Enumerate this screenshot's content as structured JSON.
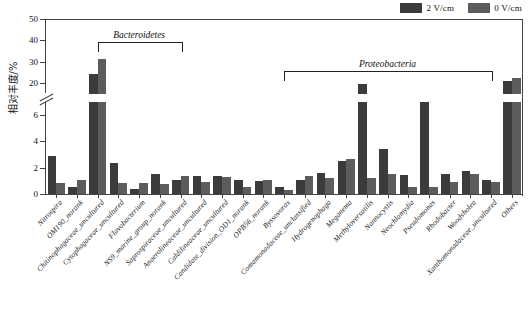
{
  "chart_data": {
    "type": "bar",
    "title": "",
    "xlabel": "",
    "ylabel": "相对丰度/%",
    "ylim": [
      0,
      50
    ],
    "axis_break": {
      "lower_max": 7,
      "upper_min": 15
    },
    "y_ticks_lower": [
      0,
      2,
      4,
      6
    ],
    "y_ticks_upper": [
      20,
      30,
      40,
      50
    ],
    "grid": false,
    "legend_position": "top-right",
    "categories": [
      "Nitrospira",
      "OM190_norank",
      "Chitinophagaceae_uncultured",
      "Cytophagaceae_uncultured",
      "Flavobacterium",
      "NS9_marine_group_norank",
      "Saprospiraceae_uncultured",
      "Anaerolineaceae_uncultured",
      "Caldilineaceae_uncultured",
      "Candidate_division_OD1_norank",
      "OPB56_norank",
      "Byssovorax",
      "Comamonadaceae_unclassified",
      "Hydrogenophaga",
      "Meganema",
      "Methyloversatilis",
      "Nannocystis",
      "Neochlamydia",
      "Pseudomonas",
      "Rhodobacter",
      "Woodsholea",
      "Xanthomonadaceae_uncultured",
      "Others"
    ],
    "series": [
      {
        "name": "2 V/cm",
        "color": "#3b3b3b",
        "values": [
          2.9,
          0.55,
          24.5,
          2.4,
          0.35,
          1.55,
          1.1,
          1.35,
          1.35,
          1.1,
          1.0,
          0.55,
          1.1,
          1.6,
          2.5,
          19.5,
          3.4,
          1.45,
          7.1,
          1.55,
          1.75,
          1.1,
          21.0
        ]
      },
      {
        "name": "0 V/cm",
        "color": "#5c5c5c",
        "values": [
          0.85,
          1.1,
          31.5,
          0.85,
          0.85,
          0.8,
          1.4,
          0.9,
          1.3,
          0.5,
          1.05,
          0.3,
          1.35,
          1.25,
          2.65,
          1.2,
          1.5,
          0.55,
          0.5,
          0.95,
          1.55,
          0.95,
          22.5
        ]
      }
    ],
    "brackets": [
      {
        "label": "Bacteroidetes",
        "from_index": 2,
        "to_index": 6
      },
      {
        "label": "Proteobacteria",
        "from_index": 11,
        "to_index": 21
      }
    ]
  },
  "legend": {
    "items": [
      {
        "label": "2 V/cm",
        "color": "#3b3b3b"
      },
      {
        "label": "0 V/cm",
        "color": "#5c5c5c"
      }
    ]
  },
  "caption": ""
}
